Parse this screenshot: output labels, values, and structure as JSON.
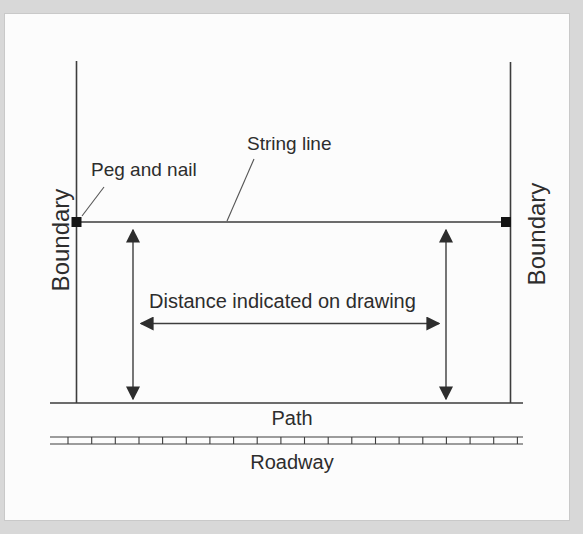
{
  "diagram": {
    "labels": {
      "peg_and_nail": "Peg and nail",
      "string_line": "String line",
      "boundary_left": "Boundary",
      "boundary_right": "Boundary",
      "distance": "Distance indicated on drawing",
      "path": "Path",
      "roadway": "Roadway"
    },
    "colors": {
      "page_background": "#d8d8d8",
      "panel_background": "#fcfcfc",
      "line": "#3d3d3d",
      "leader_line": "#555555",
      "text": "#2d2d2d",
      "peg": "#141414"
    }
  }
}
